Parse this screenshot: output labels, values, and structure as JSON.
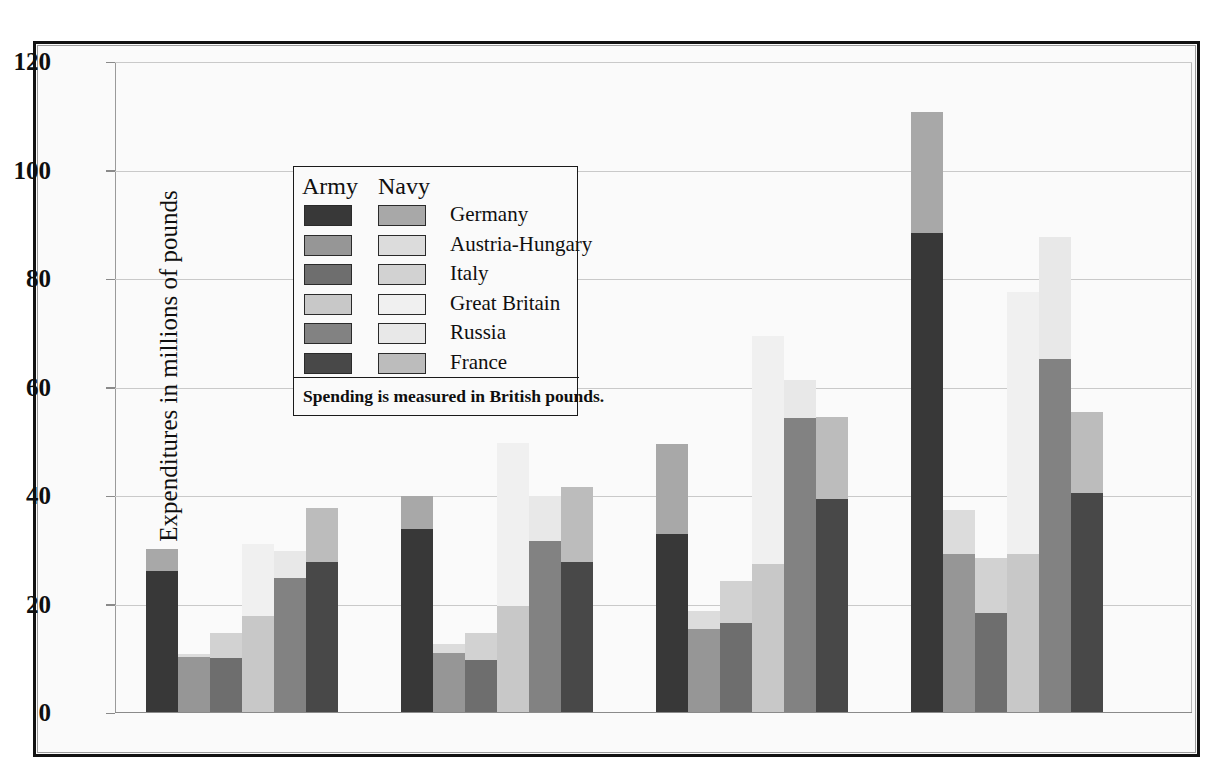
{
  "chart_data": {
    "type": "bar",
    "title": "",
    "subtitle": "",
    "xlabel": "",
    "ylabel": "Expenditures in millions of pounds",
    "categories": [
      "1890",
      "1900",
      "1910",
      "1914"
    ],
    "ylim": [
      0,
      120
    ],
    "yticks": [
      0,
      20,
      40,
      60,
      80,
      100,
      120
    ],
    "ytick_labels": [
      "0",
      "20",
      "40",
      "60",
      "80",
      "100",
      "120"
    ],
    "grid": true,
    "stacked": true,
    "stack_order": [
      "Army",
      "Navy"
    ],
    "legend_position": "upper-left-inside",
    "units": "millions of British pounds",
    "series": [
      {
        "name": "Germany",
        "army_color": "#383838",
        "navy_color": "#a8a8a8",
        "army": [
          26.2,
          34.0,
          33.0,
          88.5
        ],
        "navy": [
          4.0,
          6.0,
          16.5,
          22.2
        ],
        "totals": [
          30.2,
          40.0,
          49.5,
          110.7
        ]
      },
      {
        "name": "Austria-Hungary",
        "army_color": "#969696",
        "navy_color": "#dcdcdc",
        "army": [
          10.3,
          11.0,
          15.5,
          29.3
        ],
        "navy": [
          0.5,
          1.8,
          3.3,
          8.2
        ],
        "totals": [
          10.8,
          12.8,
          18.8,
          37.5
        ]
      },
      {
        "name": "Italy",
        "army_color": "#6e6e6e",
        "navy_color": "#d2d2d2",
        "army": [
          10.2,
          9.8,
          16.6,
          18.5
        ],
        "navy": [
          4.6,
          5.0,
          7.8,
          10.0
        ],
        "totals": [
          14.8,
          14.8,
          24.4,
          28.5
        ]
      },
      {
        "name": "Great Britain",
        "army_color": "#c8c8c8",
        "navy_color": "#f0f0f0",
        "army": [
          17.8,
          19.7,
          27.5,
          29.3
        ],
        "navy": [
          13.3,
          30.1,
          42.0,
          48.4
        ],
        "totals": [
          31.1,
          49.8,
          69.5,
          77.7
        ]
      },
      {
        "name": "Russia",
        "army_color": "#828282",
        "navy_color": "#e8e8e8",
        "army": [
          24.8,
          31.8,
          54.4,
          65.3
        ],
        "navy": [
          5.1,
          8.2,
          6.9,
          22.4
        ],
        "totals": [
          29.9,
          40.0,
          61.3,
          87.7
        ]
      },
      {
        "name": "France",
        "army_color": "#484848",
        "navy_color": "#bcbcbc",
        "army": [
          27.8,
          27.8,
          39.5,
          40.6
        ],
        "navy": [
          9.9,
          13.8,
          15.0,
          14.8
        ],
        "totals": [
          37.7,
          41.6,
          54.5,
          55.4
        ]
      }
    ]
  },
  "legend": {
    "head_army": "Army",
    "head_navy": "Navy",
    "rows": [
      {
        "label": "Germany"
      },
      {
        "label": "Austria-Hungary"
      },
      {
        "label": "Italy"
      },
      {
        "label": "Great Britain"
      },
      {
        "label": "Russia"
      },
      {
        "label": "France"
      }
    ],
    "note": "Spending is measured in British pounds."
  },
  "colors": {
    "frame": "#111111",
    "background": "#fafafa",
    "gridline": "#c9c9c9",
    "axis": "#8a8a8a",
    "text": "#0f0f0f"
  }
}
